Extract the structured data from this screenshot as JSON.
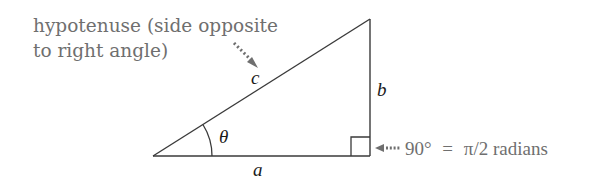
{
  "diagram": {
    "type": "right-triangle",
    "colors": {
      "stroke": "#3a3a3a",
      "label_gray": "#6f6f6f",
      "math_text": "#1a1a1a"
    },
    "hypotenuse_annotation": {
      "line1": "hypotenuse (side opposite",
      "line2": "to right angle)"
    },
    "sides": {
      "hypotenuse": "c",
      "opposite": "b",
      "adjacent": "a"
    },
    "angle_label": "θ",
    "right_angle_annotation": {
      "degrees": "90°",
      "equals": "=",
      "radians": "π/2 radians"
    }
  }
}
